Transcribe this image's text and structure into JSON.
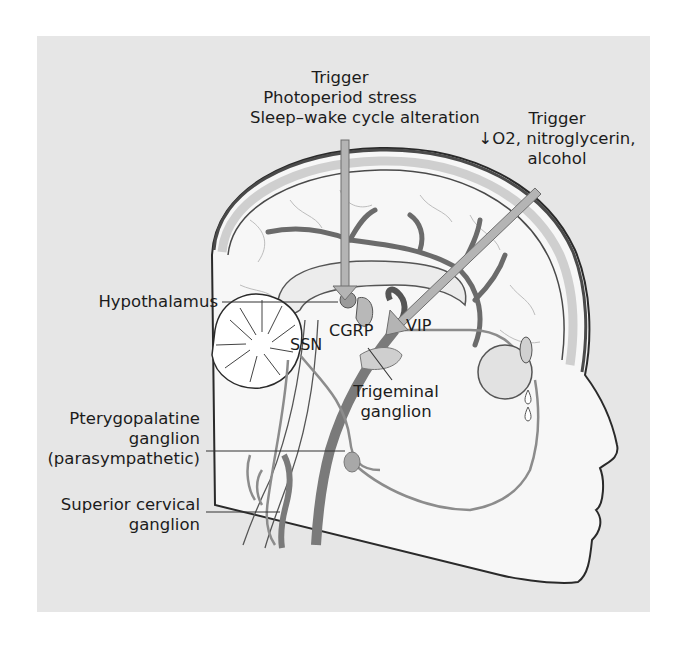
{
  "figure": {
    "colors": {
      "panel_bg": "#e6e6e6",
      "tissue": "#f7f7f7",
      "vessel": "#6b6b6b",
      "nerve": "#8c8c8c",
      "arrow_fill": "#b4b4b4",
      "arrow_stroke": "#6e6e6e",
      "outline": "#2a2a2a",
      "text": "#1c1c1c"
    }
  },
  "labels": {
    "trigger_top": {
      "line1": "Trigger",
      "line2": "Photoperiod stress",
      "line3": "Sleep–wake cycle alteration"
    },
    "trigger_right": {
      "line1": "Trigger",
      "line2": "↓O2, nitroglycerin,",
      "line3": "alcohol"
    },
    "hypothalamus": "Hypothalamus",
    "ssn": "SSN",
    "cgrp": "CGRP",
    "vip": "VIP",
    "trigeminal": {
      "line1": "Trigeminal",
      "line2": "ganglion"
    },
    "pterygopalatine": {
      "line1": "Pterygopalatine",
      "line2": "ganglion",
      "line3": "(parasympathetic)"
    },
    "superior_cervical": {
      "line1": "Superior cervical",
      "line2": "ganglion"
    }
  }
}
